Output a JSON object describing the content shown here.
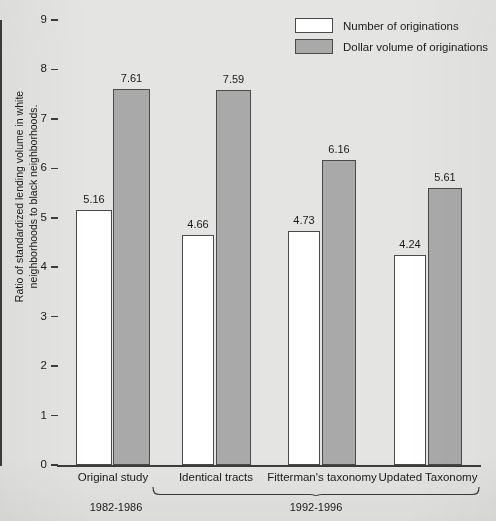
{
  "chart_data": {
    "type": "bar",
    "title": "",
    "xlabel": "",
    "ylabel": "Ratio of standardized lending volume in white neighborhoods to black neighborhoods.",
    "ylim": [
      0,
      9
    ],
    "ytick_labels": [
      "9",
      "8",
      "7",
      "6",
      "5",
      "4",
      "3",
      "2",
      "1",
      "0"
    ],
    "ytick_values": [
      9,
      8,
      7,
      6,
      5,
      4,
      3,
      2,
      1,
      0
    ],
    "grid": false,
    "legend_position": "top-right",
    "categories": [
      "Original study",
      "Identical tracts",
      "Fitterman's taxonomy",
      "Updated Taxonomy"
    ],
    "series": [
      {
        "name": "Number of originations",
        "color": "#ffffff",
        "values": [
          5.16,
          4.66,
          4.73,
          4.24
        ],
        "value_labels": [
          "5.16",
          "4.66",
          "4.73",
          "4.24"
        ]
      },
      {
        "name": "Dollar volume of originations",
        "color": "#a9a9a9",
        "values": [
          7.61,
          7.59,
          6.16,
          5.61
        ],
        "value_labels": [
          "7.61",
          "7.59",
          "6.16",
          "5.61"
        ]
      }
    ],
    "period_groups": [
      {
        "label": "1982-1986",
        "categories": [
          "Original study"
        ]
      },
      {
        "label": "1992-1996",
        "categories": [
          "Identical tracts",
          "Fitterman's taxonomy",
          "Updated Taxonomy"
        ]
      }
    ]
  }
}
